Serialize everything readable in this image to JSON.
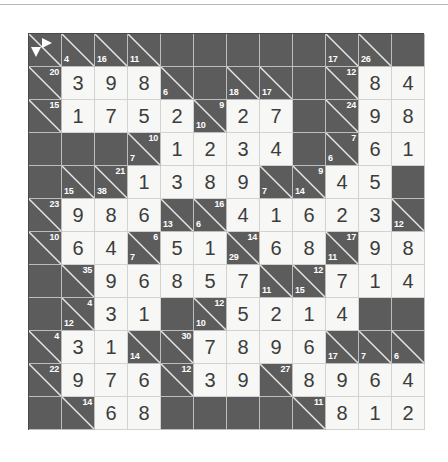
{
  "puzzle": {
    "name": "kakuro-grid",
    "rows": 12,
    "cols": 12,
    "colors": {
      "block": "#5c5c5c",
      "fill": "#f7f7f5",
      "digit": "#3c3c3c",
      "clue_text": "#ffffff",
      "diagonal": "#e8e8e8",
      "frame": "#4a4a4a"
    },
    "legend": {
      "arrow_right": "across-arrow",
      "arrow_down": "down-arrow"
    },
    "cells": [
      [
        {
          "t": "corner",
          "arrows": true
        },
        {
          "t": "clue",
          "down": "4"
        },
        {
          "t": "clue",
          "down": "16"
        },
        {
          "t": "clue",
          "down": "11"
        },
        {
          "t": "block"
        },
        {
          "t": "block"
        },
        {
          "t": "block"
        },
        {
          "t": "block"
        },
        {
          "t": "block"
        },
        {
          "t": "clue",
          "down": "17"
        },
        {
          "t": "clue",
          "down": "26"
        },
        {
          "t": "block"
        }
      ],
      [
        {
          "t": "clue",
          "across": "20"
        },
        {
          "t": "fill",
          "v": "3"
        },
        {
          "t": "fill",
          "v": "9"
        },
        {
          "t": "fill",
          "v": "8"
        },
        {
          "t": "clue",
          "down": "6"
        },
        {
          "t": "block"
        },
        {
          "t": "clue",
          "down": "18"
        },
        {
          "t": "clue",
          "down": "17"
        },
        {
          "t": "block"
        },
        {
          "t": "clue",
          "across": "12"
        },
        {
          "t": "fill",
          "v": "8"
        },
        {
          "t": "fill",
          "v": "4"
        }
      ],
      [
        {
          "t": "clue",
          "across": "15"
        },
        {
          "t": "fill",
          "v": "1"
        },
        {
          "t": "fill",
          "v": "7"
        },
        {
          "t": "fill",
          "v": "5"
        },
        {
          "t": "fill",
          "v": "2"
        },
        {
          "t": "clue",
          "across": "9",
          "down": "10"
        },
        {
          "t": "fill",
          "v": "2"
        },
        {
          "t": "fill",
          "v": "7"
        },
        {
          "t": "block"
        },
        {
          "t": "clue",
          "across": "24"
        },
        {
          "t": "fill",
          "v": "9"
        },
        {
          "t": "fill",
          "v": "8"
        }
      ],
      [
        {
          "t": "block"
        },
        {
          "t": "block"
        },
        {
          "t": "block"
        },
        {
          "t": "clue",
          "across": "10",
          "down": "7"
        },
        {
          "t": "fill",
          "v": "1"
        },
        {
          "t": "fill",
          "v": "2"
        },
        {
          "t": "fill",
          "v": "3"
        },
        {
          "t": "fill",
          "v": "4"
        },
        {
          "t": "block"
        },
        {
          "t": "clue",
          "across": "7",
          "down": "6"
        },
        {
          "t": "fill",
          "v": "6"
        },
        {
          "t": "fill",
          "v": "1"
        }
      ],
      [
        {
          "t": "block"
        },
        {
          "t": "clue",
          "down": "15"
        },
        {
          "t": "clue",
          "across": "21",
          "down": "38"
        },
        {
          "t": "fill",
          "v": "1"
        },
        {
          "t": "fill",
          "v": "3"
        },
        {
          "t": "fill",
          "v": "8"
        },
        {
          "t": "fill",
          "v": "9"
        },
        {
          "t": "clue",
          "down": "7"
        },
        {
          "t": "clue",
          "across": "9",
          "down": "14"
        },
        {
          "t": "fill",
          "v": "4"
        },
        {
          "t": "fill",
          "v": "5"
        },
        {
          "t": "block"
        }
      ],
      [
        {
          "t": "clue",
          "across": "23"
        },
        {
          "t": "fill",
          "v": "9"
        },
        {
          "t": "fill",
          "v": "8"
        },
        {
          "t": "fill",
          "v": "6"
        },
        {
          "t": "clue",
          "down": "13"
        },
        {
          "t": "clue",
          "across": "16",
          "down": "6"
        },
        {
          "t": "fill",
          "v": "4"
        },
        {
          "t": "fill",
          "v": "1"
        },
        {
          "t": "fill",
          "v": "6"
        },
        {
          "t": "fill",
          "v": "2"
        },
        {
          "t": "fill",
          "v": "3"
        },
        {
          "t": "clue",
          "down": "12"
        }
      ],
      [
        {
          "t": "clue",
          "across": "10"
        },
        {
          "t": "fill",
          "v": "6"
        },
        {
          "t": "fill",
          "v": "4"
        },
        {
          "t": "clue",
          "across": "6",
          "down": "7"
        },
        {
          "t": "fill",
          "v": "5"
        },
        {
          "t": "fill",
          "v": "1"
        },
        {
          "t": "clue",
          "across": "14",
          "down": "29"
        },
        {
          "t": "fill",
          "v": "6"
        },
        {
          "t": "fill",
          "v": "8"
        },
        {
          "t": "clue",
          "across": "17",
          "down": "11"
        },
        {
          "t": "fill",
          "v": "9"
        },
        {
          "t": "fill",
          "v": "8"
        }
      ],
      [
        {
          "t": "block"
        },
        {
          "t": "clue",
          "across": "35"
        },
        {
          "t": "fill",
          "v": "9"
        },
        {
          "t": "fill",
          "v": "6"
        },
        {
          "t": "fill",
          "v": "8"
        },
        {
          "t": "fill",
          "v": "5"
        },
        {
          "t": "fill",
          "v": "7"
        },
        {
          "t": "clue",
          "down": "11"
        },
        {
          "t": "clue",
          "across": "12",
          "down": "15"
        },
        {
          "t": "fill",
          "v": "7"
        },
        {
          "t": "fill",
          "v": "1"
        },
        {
          "t": "fill",
          "v": "4"
        }
      ],
      [
        {
          "t": "block"
        },
        {
          "t": "clue",
          "across": "4",
          "down": "12"
        },
        {
          "t": "fill",
          "v": "3"
        },
        {
          "t": "fill",
          "v": "1"
        },
        {
          "t": "block"
        },
        {
          "t": "clue",
          "across": "12",
          "down": "10"
        },
        {
          "t": "fill",
          "v": "5"
        },
        {
          "t": "fill",
          "v": "2"
        },
        {
          "t": "fill",
          "v": "1"
        },
        {
          "t": "fill",
          "v": "4"
        },
        {
          "t": "block"
        },
        {
          "t": "block"
        }
      ],
      [
        {
          "t": "clue",
          "across": "4"
        },
        {
          "t": "fill",
          "v": "3"
        },
        {
          "t": "fill",
          "v": "1"
        },
        {
          "t": "clue",
          "down": "14"
        },
        {
          "t": "clue",
          "across": "30"
        },
        {
          "t": "fill",
          "v": "7"
        },
        {
          "t": "fill",
          "v": "8"
        },
        {
          "t": "fill",
          "v": "9"
        },
        {
          "t": "fill",
          "v": "6"
        },
        {
          "t": "clue",
          "down": "17"
        },
        {
          "t": "clue",
          "down": "7"
        },
        {
          "t": "clue",
          "down": "6"
        }
      ],
      [
        {
          "t": "clue",
          "across": "22"
        },
        {
          "t": "fill",
          "v": "9"
        },
        {
          "t": "fill",
          "v": "7"
        },
        {
          "t": "fill",
          "v": "6"
        },
        {
          "t": "clue",
          "across": "12"
        },
        {
          "t": "fill",
          "v": "3"
        },
        {
          "t": "fill",
          "v": "9"
        },
        {
          "t": "clue",
          "across": "27"
        },
        {
          "t": "fill",
          "v": "8"
        },
        {
          "t": "fill",
          "v": "9"
        },
        {
          "t": "fill",
          "v": "6"
        },
        {
          "t": "fill",
          "v": "4"
        }
      ],
      [
        {
          "t": "block"
        },
        {
          "t": "clue",
          "across": "14"
        },
        {
          "t": "fill",
          "v": "6"
        },
        {
          "t": "fill",
          "v": "8"
        },
        {
          "t": "block"
        },
        {
          "t": "block"
        },
        {
          "t": "block"
        },
        {
          "t": "block"
        },
        {
          "t": "clue",
          "across": "11"
        },
        {
          "t": "fill",
          "v": "8"
        },
        {
          "t": "fill",
          "v": "1"
        },
        {
          "t": "fill",
          "v": "2"
        }
      ]
    ]
  }
}
